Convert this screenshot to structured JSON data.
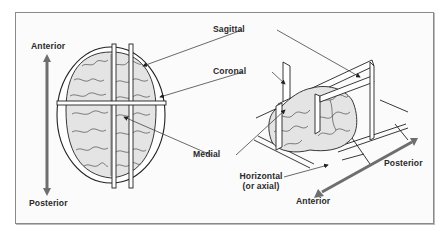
{
  "figure": {
    "left_panel": {
      "view": "top (dorsal) view",
      "axis_labels": {
        "top": "Anterior",
        "bottom": "Posterior"
      }
    },
    "right_panel": {
      "view": "3D oblique view",
      "axis_labels": {
        "back": "Posterior",
        "front": "Anterior"
      }
    },
    "plane_labels": {
      "sagittal": "Sagittal",
      "coronal": "Coronal",
      "medial": "Medial",
      "horizontal_line1": "Horizontal",
      "horizontal_line2": "(or axial)"
    },
    "colors": {
      "frame_border": "#8a8a8a",
      "brain_fill": "#e4e4e4",
      "line": "#222222",
      "arrow": "#6e6e6e",
      "plane_fill": "#ffffff"
    }
  }
}
